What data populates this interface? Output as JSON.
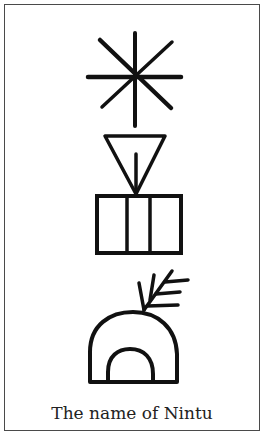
{
  "figure": {
    "caption": "The name of Nintu",
    "signs": [
      {
        "name": "star-sign",
        "description": "eight-pointed star (dingir)"
      },
      {
        "name": "triangle-sign",
        "description": "inverted triangle with central stroke"
      },
      {
        "name": "box-sign",
        "description": "rectangle divided into three sections"
      },
      {
        "name": "arch-sign",
        "description": "double arch with branch"
      }
    ],
    "colors": {
      "ink": "#111111",
      "border": "#4a4a4a",
      "background": "#ffffff"
    }
  }
}
